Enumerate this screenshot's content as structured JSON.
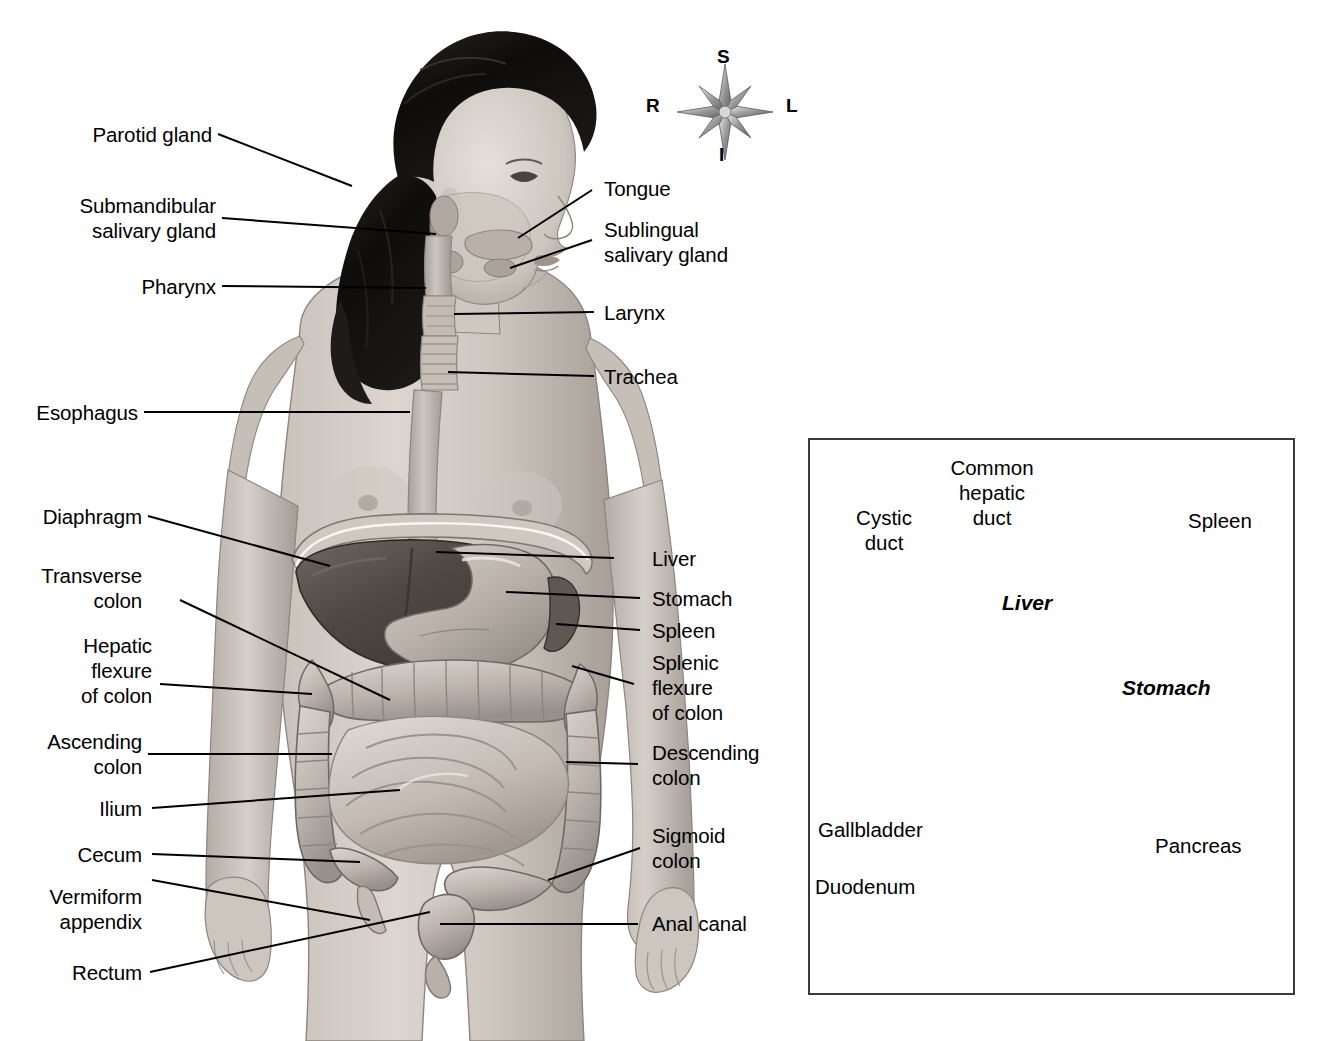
{
  "figure": {
    "orientation_compass": {
      "superior": "S",
      "inferior": "I",
      "right": "R",
      "left": "L"
    }
  },
  "main_labels_left": [
    {
      "text": "Parotid gland"
    },
    {
      "text": "Submandibular\nsalivary gland"
    },
    {
      "text": "Pharynx"
    },
    {
      "text": "Esophagus"
    },
    {
      "text": "Diaphragm"
    },
    {
      "text": "Transverse\ncolon"
    },
    {
      "text": "Hepatic\nflexure\nof colon"
    },
    {
      "text": "Ascending\ncolon"
    },
    {
      "text": "Ilium"
    },
    {
      "text": "Cecum"
    },
    {
      "text": "Vermiform\nappendix"
    },
    {
      "text": "Rectum"
    }
  ],
  "main_labels_right": [
    {
      "text": "Tongue"
    },
    {
      "text": "Sublingual\nsalivary gland"
    },
    {
      "text": "Larynx"
    },
    {
      "text": "Trachea"
    },
    {
      "text": "Liver"
    },
    {
      "text": "Stomach"
    },
    {
      "text": "Spleen"
    },
    {
      "text": "Splenic\nflexure\nof colon"
    },
    {
      "text": "Descending\ncolon"
    },
    {
      "text": "Sigmoid\ncolon"
    },
    {
      "text": "Anal canal"
    }
  ],
  "inset": {
    "labels": [
      {
        "text": "Cystic\nduct"
      },
      {
        "text": "Common\nhepatic\nduct"
      },
      {
        "text": "Spleen"
      },
      {
        "text": "Gallbladder"
      },
      {
        "text": "Pancreas"
      },
      {
        "text": "Duodenum"
      }
    ],
    "organ_labels": [
      {
        "text": "Liver"
      },
      {
        "text": "Stomach"
      }
    ]
  },
  "colors": {
    "line": "#000000",
    "frame": "#3a3a3a",
    "background": "#ffffff",
    "skin_light": "#d8d2cc",
    "skin_mid": "#bab2ab",
    "skin_shadow": "#9b938c",
    "hair_dark": "#121212",
    "liver_dark": "#5a5a5a",
    "organ_mid": "#b3aba4",
    "organ_light": "#cfc8c1"
  }
}
